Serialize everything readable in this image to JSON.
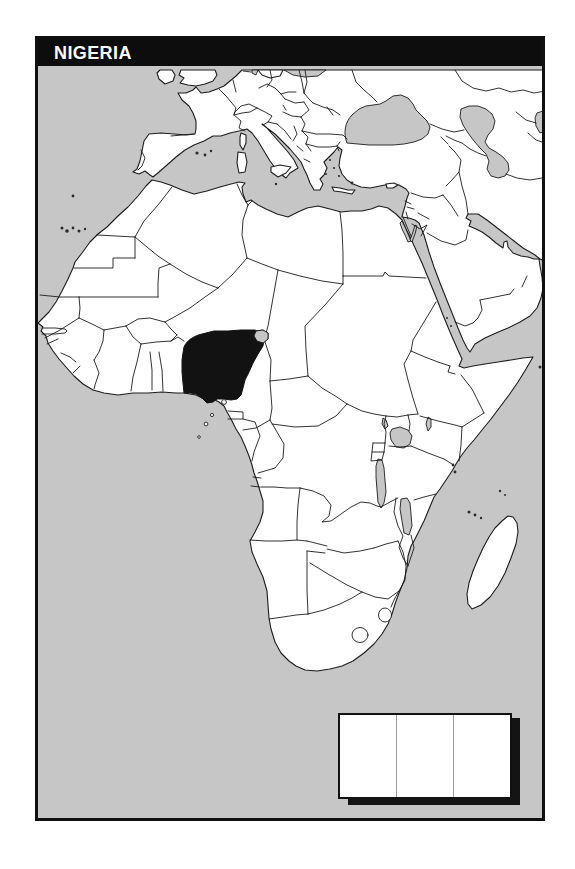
{
  "map": {
    "title": "NIGERIA",
    "highlighted_country": "Nigeria",
    "colors": {
      "sea": "#c6c6c6",
      "land": "#ffffff",
      "highlight": "#121212",
      "border_line": "#1c1c1c",
      "frame": "#101010",
      "title_bar": "#0d0d0d",
      "title_text": "#ffffff",
      "legend_shadow": "#141414",
      "legend_divider": "#9a9a9a"
    },
    "legend": {
      "columns": 3,
      "labels": [
        "",
        "",
        ""
      ]
    }
  }
}
